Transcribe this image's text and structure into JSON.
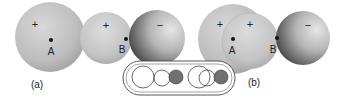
{
  "panel_a": {
    "caption": "(a)",
    "sphere1_charge": "+",
    "sphere2_charge": "+",
    "sphere3_charge": "−",
    "point_a": "A",
    "point_b": "B"
  },
  "panel_b": {
    "caption": "(b)",
    "sphere1_charge": "+",
    "sphere2_charge": "+",
    "sphere3_charge": "−",
    "point_a": "A",
    "point_b": "B"
  },
  "colors": {
    "positive_sphere": "#c4c4c4",
    "negative_sphere": "#6e6e6e",
    "inset_filled": "#707070"
  }
}
